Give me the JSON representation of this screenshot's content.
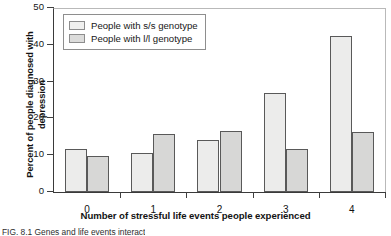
{
  "figure": {
    "caption": "FIG. 8.1  Genes and life events interact"
  },
  "chart_data": {
    "type": "bar",
    "title": "",
    "subtitle": "",
    "xlabel": "Number of stressful life events people experienced",
    "ylabel": "Percent of people diagnosed with depression",
    "categories": [
      "0",
      "1",
      "2",
      "3",
      "4"
    ],
    "series": [
      {
        "name": "People with s/s genotype",
        "color": "#ececeb",
        "values": [
          11.8,
          10.7,
          14.2,
          26.8,
          42.5
        ]
      },
      {
        "name": "People with l/l genotype",
        "color": "#d7d7d6",
        "values": [
          9.8,
          15.7,
          16.7,
          11.8,
          16.2
        ]
      }
    ],
    "ylim": [
      0,
      50
    ],
    "yticks": [
      0,
      10,
      20,
      30,
      40,
      50
    ],
    "ytick_labels": [
      "0",
      "10",
      "20",
      "30",
      "40",
      "50"
    ],
    "xtick_labels": [
      "0",
      "1",
      "2",
      "3",
      "4"
    ],
    "grid": false,
    "legend_position": "upper left"
  }
}
